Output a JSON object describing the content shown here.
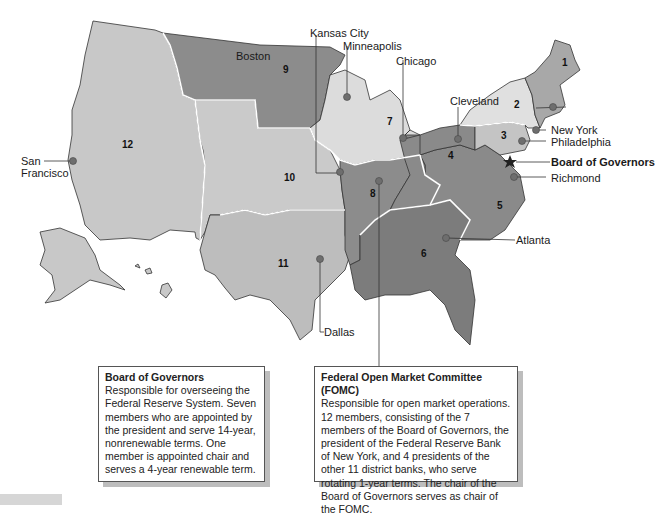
{
  "map": {
    "title": "Federal Reserve System districts",
    "colors": {
      "district_light": "#dcdcdc",
      "district_mid": "#c4c4c4",
      "district_dark": "#8a8a8a",
      "district_darker": "#7a7a7a",
      "state_border": "#333333",
      "district_border": "#ffffff",
      "marker": "#6e6e6e"
    },
    "districts": [
      {
        "number": "1",
        "shade": "mid"
      },
      {
        "number": "2",
        "shade": "light"
      },
      {
        "number": "3",
        "shade": "mid"
      },
      {
        "number": "4",
        "shade": "dark"
      },
      {
        "number": "5",
        "shade": "dark"
      },
      {
        "number": "6",
        "shade": "darker"
      },
      {
        "number": "7",
        "shade": "light"
      },
      {
        "number": "8",
        "shade": "dark"
      },
      {
        "number": "9",
        "shade": "dark"
      },
      {
        "number": "10",
        "shade": "mid"
      },
      {
        "number": "11",
        "shade": "mid"
      },
      {
        "number": "12",
        "shade": "mid"
      }
    ],
    "cities": [
      {
        "name": "Boston"
      },
      {
        "name": "New York"
      },
      {
        "name": "Philadelphia"
      },
      {
        "name": "Cleveland"
      },
      {
        "name": "Richmond"
      },
      {
        "name": "Atlanta"
      },
      {
        "name": "Chicago"
      },
      {
        "name": "St. Louis"
      },
      {
        "name": "Minneapolis"
      },
      {
        "name": "Kansas City"
      },
      {
        "name": "Dallas"
      },
      {
        "name": "San\nFrancisco",
        "line1": "San",
        "line2": "Francisco"
      }
    ],
    "board_of_governors_marker": {
      "label": "Board of Governors",
      "icon": "star-icon"
    }
  },
  "boxes": {
    "board": {
      "title": "Board of Governors",
      "body": "Responsible for overseeing the Federal Reserve System. Seven members who are appointed by the president and serve 14-year, nonrenewable terms.  One member is appointed chair and serves a 4-year renewable term."
    },
    "fomc": {
      "title": "Federal Open Market Committee (FOMC)",
      "body": "Responsible for open market operations. 12 members, consisting of the 7 members of the Board of Governors, the president of the Federal Reserve Bank of New York, and 4 presidents of the other 11 district banks, who serve rotating 1-year terms. The chair of the Board of Governors serves as chair of the FOMC."
    }
  }
}
